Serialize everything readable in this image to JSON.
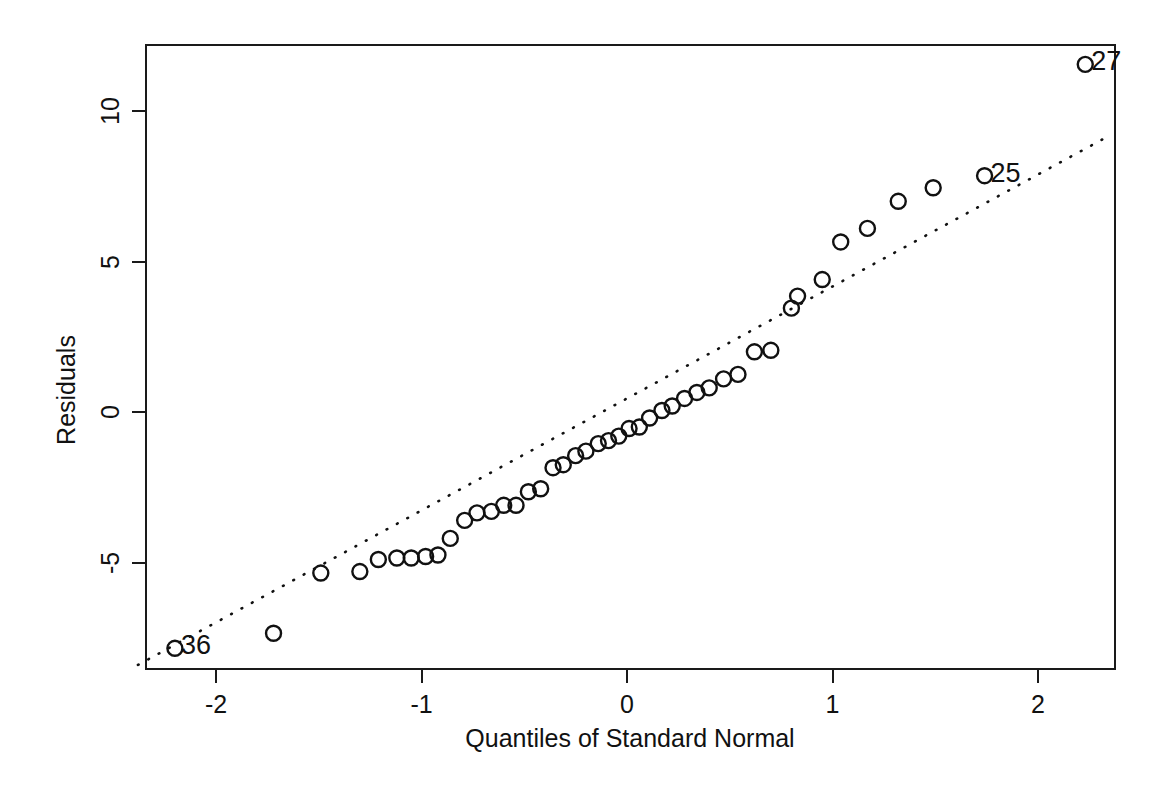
{
  "chart_data": {
    "type": "scatter",
    "title": "",
    "subtitle": "",
    "xlabel": "Quantiles of Standard Normal",
    "ylabel": "Residuals",
    "xlim": [
      -2.38,
      2.35
    ],
    "ylim": [
      -8.55,
      12.1
    ],
    "xticks": [
      -2,
      -1,
      0,
      1,
      2
    ],
    "xticklabels": [
      "-2",
      "-1",
      "0",
      "1",
      "2"
    ],
    "yticks": [
      -5,
      0,
      5,
      10
    ],
    "yticklabels": [
      "-5",
      "0",
      "5",
      "10"
    ],
    "grid": false,
    "legend": null,
    "marker": "open-circle",
    "reference_line": {
      "style": "dotted",
      "slope": 3.72,
      "intercept": 0.45,
      "x_start": -2.38,
      "x_end": 2.33
    },
    "series": [
      {
        "name": "Residuals",
        "x": [
          -2.2,
          -1.72,
          -1.49,
          -1.3,
          -1.21,
          -1.12,
          -1.05,
          -0.98,
          -0.92,
          -0.86,
          -0.79,
          -0.73,
          -0.66,
          -0.6,
          -0.54,
          -0.48,
          -0.42,
          -0.36,
          -0.31,
          -0.25,
          -0.2,
          -0.14,
          -0.09,
          -0.04,
          0.01,
          0.06,
          0.11,
          0.17,
          0.22,
          0.28,
          0.34,
          0.4,
          0.47,
          0.54,
          0.62,
          0.7,
          0.8,
          0.83,
          0.95,
          1.04,
          1.17,
          1.32,
          1.49,
          1.74,
          2.23
        ],
        "y": [
          -7.85,
          -7.35,
          -5.35,
          -5.3,
          -4.9,
          -4.85,
          -4.85,
          -4.8,
          -4.75,
          -4.2,
          -3.6,
          -3.35,
          -3.3,
          -3.1,
          -3.1,
          -2.65,
          -2.55,
          -1.85,
          -1.75,
          -1.45,
          -1.3,
          -1.05,
          -0.95,
          -0.8,
          -0.55,
          -0.5,
          -0.2,
          0.05,
          0.2,
          0.45,
          0.65,
          0.8,
          1.1,
          1.25,
          2.0,
          2.05,
          3.45,
          3.85,
          4.4,
          5.65,
          6.1,
          7.0,
          7.45,
          7.85,
          11.55
        ]
      }
    ],
    "annotations": [
      {
        "label": "36",
        "x": -2.2,
        "y": -7.85,
        "text_offset": "right"
      },
      {
        "label": "25",
        "x": 1.74,
        "y": 7.85,
        "text_offset": "right"
      },
      {
        "label": "27",
        "x": 2.23,
        "y": 11.55,
        "text_offset": "right"
      }
    ]
  },
  "plot": {
    "frame": {
      "left": 145,
      "top": 44,
      "width": 971,
      "height": 626
    },
    "axis_map": {
      "x_zero_px": 627,
      "x_unit_px": 205.5,
      "y_zero_px": 412,
      "y_unit_px": 30.1
    },
    "colors": {
      "axis": "#1a1a1a",
      "marker": "#111111",
      "reference_line": "#111111",
      "background": "#ffffff"
    }
  }
}
